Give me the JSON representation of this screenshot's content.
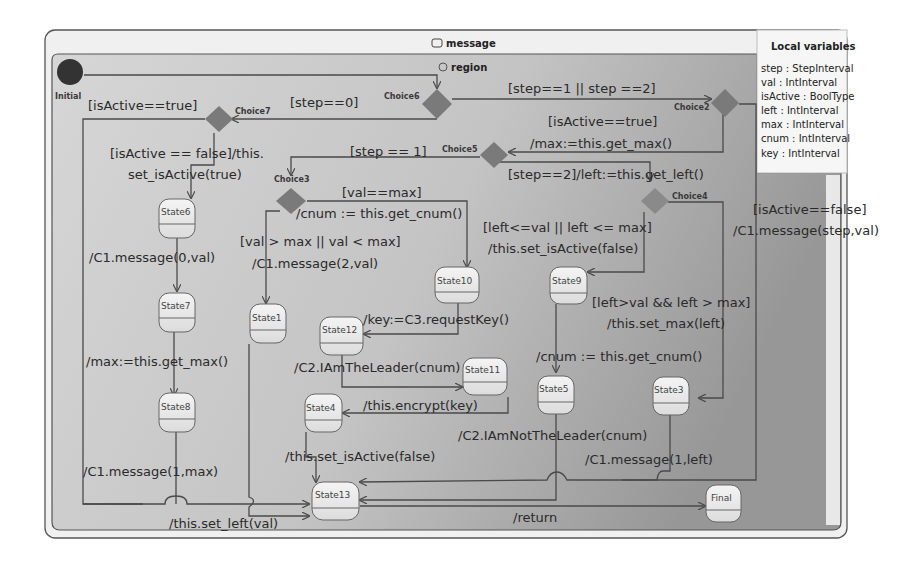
{
  "machine": {
    "title": "message",
    "region_label": "region",
    "colors": {
      "background": "#ffffff",
      "machine_fill": "#f3f3f3",
      "region_fill": "#c8c8c8",
      "region_fill_dark": "#9a9a9a",
      "choice": "#7a7a7a",
      "initial": "#333333",
      "state_fill": "#eeeeee",
      "edge": "#4a4a4a"
    }
  },
  "local_variables": {
    "title": "Local variables",
    "items": [
      "step : StepInterval",
      "val : IntInterval",
      "isActive : BoolType",
      "left : IntInterval",
      "max : IntInterval",
      "cnum : IntInterval",
      "key : IntInterval"
    ]
  },
  "pseudostates": {
    "initial": "Initial",
    "choice2": "Choice2",
    "choice3": "Choice3",
    "choice4": "Choice4",
    "choice5": "Choice5",
    "choice6": "Choice6",
    "choice7": "Choice7",
    "final": "Final"
  },
  "states": {
    "s1": "State1",
    "s3": "State3",
    "s4": "State4",
    "s5": "State5",
    "s6": "State6",
    "s7": "State7",
    "s8": "State8",
    "s9": "State9",
    "s10": "State10",
    "s11": "State11",
    "s12": "State12",
    "s13": "State13"
  },
  "transitions": {
    "c6_c7": "[step==0]",
    "c6_c2": "[step==1 || step ==2]",
    "c7_true": "[isActive==true]",
    "c7_false_1": "[isActive == false]/this.",
    "c7_false_2": "set_isActive(true)",
    "c2_true_1": "[isActive==true]",
    "c2_true_2": "/max:=this.get_max()",
    "c5_c3": "[step == 1]",
    "c5_c4": "[step==2]/left:=this.get_left()",
    "c3_s10_1": "[val==max]",
    "c3_s10_2": "/cnum := this.get_cnum()",
    "c3_s1_1": "[val > max || val < max]",
    "c3_s1_2": "/C1.message(2,val)",
    "c4_s9_1": "[left<=val || left <= max]",
    "c4_s9_2": "/this.set_isActive(false)",
    "c4_s3_1": "[left>val && left > max]",
    "c4_s3_2": "/this.set_max(left)",
    "c2_false_1": "[isActive==false]",
    "c2_false_2": "/C1.message(step,val)",
    "s6_s7": "/C1.message(0,val)",
    "s7_s8": "/max:=this.get_max()",
    "s8_s13": "/C1.message(1,max)",
    "s10_s12": "/key:=C3.requestKey()",
    "s12_s11": "/C2.IAmTheLeader(cnum)",
    "s11_s4": "/this.encrypt(key)",
    "s4_s13": "/this.set_isActive(false)",
    "s9_s5": "/cnum := this.get_cnum()",
    "s5_s13": "/C2.IAmNotTheLeader(cnum)",
    "s3_s13": "/C1.message(1,left)",
    "s1_s13": "/this.set_left(val)",
    "s13_final": "/return"
  }
}
